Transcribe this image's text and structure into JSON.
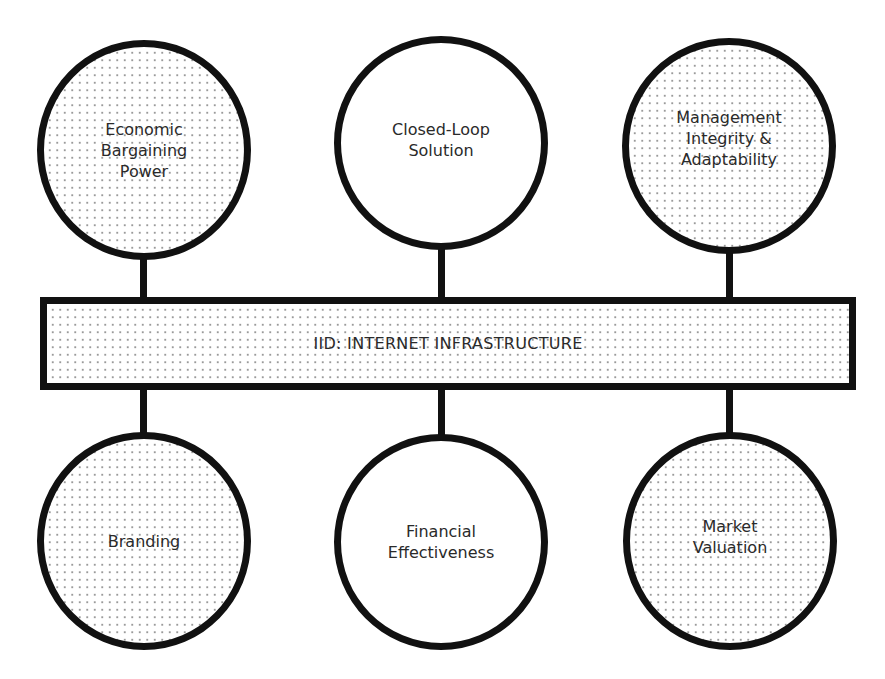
{
  "diagram": {
    "type": "hub-bus",
    "center_bar": {
      "label": "IID: INTERNET INFRASTRUCTURE",
      "fill": "dotted"
    },
    "top_nodes": [
      {
        "label": "Economic\nBargaining\nPower",
        "fill": "dotted"
      },
      {
        "label": "Closed-Loop\nSolution",
        "fill": "plain"
      },
      {
        "label": "Management\nIntegrity &\nAdaptability",
        "fill": "dotted"
      }
    ],
    "bottom_nodes": [
      {
        "label": "Branding",
        "fill": "dotted"
      },
      {
        "label": "Financial\nEffectiveness",
        "fill": "plain"
      },
      {
        "label": "Market\nValuation",
        "fill": "dotted"
      }
    ],
    "edges": [
      [
        "Economic Bargaining Power",
        "IID: INTERNET INFRASTRUCTURE"
      ],
      [
        "Closed-Loop Solution",
        "IID: INTERNET INFRASTRUCTURE"
      ],
      [
        "Management Integrity & Adaptability",
        "IID: INTERNET INFRASTRUCTURE"
      ],
      [
        "IID: INTERNET INFRASTRUCTURE",
        "Branding"
      ],
      [
        "IID: INTERNET INFRASTRUCTURE",
        "Financial Effectiveness"
      ],
      [
        "IID: INTERNET INFRASTRUCTURE",
        "Market Valuation"
      ]
    ],
    "colors": {
      "stroke": "#111111",
      "text": "#2a2a2a",
      "dot": "#9a9a9a",
      "background": "#ffffff"
    }
  }
}
